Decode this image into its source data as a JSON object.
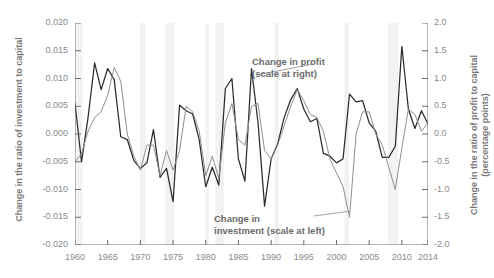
{
  "chart_data": {
    "type": "line",
    "title": "",
    "xlabel": "",
    "ylabel_left": "Change in the ratio of investment to capital",
    "ylabel_right_line1": "Change in the ratio of profit to capital",
    "ylabel_right_line2": "(percentage points)",
    "x": [
      1960,
      1961,
      1962,
      1963,
      1964,
      1965,
      1966,
      1967,
      1968,
      1969,
      1970,
      1971,
      1972,
      1973,
      1974,
      1975,
      1976,
      1977,
      1978,
      1979,
      1980,
      1981,
      1982,
      1983,
      1984,
      1985,
      1986,
      1987,
      1988,
      1989,
      1990,
      1991,
      1992,
      1993,
      1994,
      1995,
      1996,
      1997,
      1998,
      1999,
      2000,
      2001,
      2002,
      2003,
      2004,
      2005,
      2006,
      2007,
      2008,
      2009,
      2010,
      2011,
      2012,
      2013,
      2014
    ],
    "xlim": [
      1960,
      2014
    ],
    "ylim_left": [
      -0.02,
      0.02
    ],
    "ylim_right": [
      -2.0,
      2.0
    ],
    "yticks_left": [
      "0.020",
      "0.015",
      "0.010",
      "0.005",
      "0.000",
      "-0.005",
      "-0.010",
      "-0.015",
      "-0.020"
    ],
    "yticks_right": [
      "2.0",
      "1.5",
      "1.0",
      "0.5",
      "0.0",
      "-0.5",
      "-1.0",
      "-1.5",
      "-2.0"
    ],
    "xticks": [
      1960,
      1965,
      1970,
      1975,
      1980,
      1985,
      1990,
      1995,
      2000,
      2005,
      2010,
      2014
    ],
    "grid": false,
    "legend_position": "inline-annotation",
    "series": [
      {
        "name": "Change in profit (scale at right)",
        "axis": "right",
        "color": "#2b2b2b",
        "units": "percentage points",
        "values": [
          0.55,
          -0.5,
          0.3,
          1.28,
          0.8,
          1.18,
          0.98,
          -0.05,
          -0.1,
          -0.48,
          -0.62,
          -0.52,
          0.08,
          -0.78,
          -0.62,
          -1.22,
          0.52,
          0.42,
          0.36,
          -0.1,
          -0.95,
          -0.6,
          -0.92,
          0.82,
          1.0,
          -0.45,
          -0.85,
          1.18,
          0.2,
          -1.3,
          -0.45,
          -0.18,
          0.3,
          0.62,
          0.82,
          0.45,
          0.22,
          0.28,
          -0.35,
          -0.4,
          -0.52,
          -0.45,
          0.72,
          0.58,
          0.6,
          0.2,
          0.05,
          -0.42,
          -0.42,
          -0.22,
          1.58,
          0.45,
          0.1,
          0.42,
          0.18
        ]
      },
      {
        "name": "Change in investment (scale at left)",
        "axis": "left",
        "color": "#8f8f8f",
        "units": "ratio",
        "values": [
          -0.005,
          -0.0035,
          0.0005,
          0.003,
          0.004,
          0.007,
          0.012,
          0.0095,
          0.0,
          -0.004,
          -0.0065,
          -0.002,
          -0.002,
          -0.0075,
          -0.003,
          -0.0065,
          -0.003,
          0.005,
          0.004,
          0.0005,
          -0.0075,
          -0.004,
          -0.008,
          0.002,
          0.0055,
          -0.001,
          -0.002,
          0.005,
          0.0055,
          -0.003,
          -0.0045,
          -0.002,
          0.0015,
          0.005,
          0.008,
          0.006,
          0.0035,
          0.003,
          0.0005,
          -0.0045,
          -0.007,
          -0.0095,
          -0.015,
          0.0,
          0.004,
          0.004,
          0.0,
          -0.002,
          -0.006,
          -0.01,
          -0.0025,
          0.0045,
          0.0035,
          0.0005,
          0.002
        ]
      }
    ],
    "shaded_bands": [
      {
        "label": "recession-1960-61",
        "start": 1960.2,
        "end": 1961.1
      },
      {
        "label": "recession-1969-70",
        "start": 1969.9,
        "end": 1970.8
      },
      {
        "label": "recession-1973-75",
        "start": 1973.8,
        "end": 1975.2
      },
      {
        "label": "recession-1980",
        "start": 1980.0,
        "end": 1980.5
      },
      {
        "label": "recession-1981-82",
        "start": 1981.5,
        "end": 1982.8
      },
      {
        "label": "recession-1990-91",
        "start": 1990.5,
        "end": 1991.2
      },
      {
        "label": "recession-2001",
        "start": 2001.2,
        "end": 2001.9
      },
      {
        "label": "recession-2007-09",
        "start": 2007.9,
        "end": 2009.4
      }
    ],
    "band_color": "#f2f2f2"
  },
  "annotations": {
    "profit_line1": "Change in profit",
    "profit_line2": "(scale at right)",
    "investment_line1": "Change in",
    "investment_line2": "investment (scale at left)"
  }
}
